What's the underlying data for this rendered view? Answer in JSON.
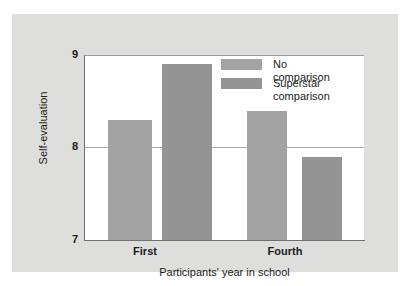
{
  "chart_data": {
    "type": "bar",
    "title": "",
    "xlabel": "Participants' year in school",
    "ylabel": "Self-evaluation",
    "categories": [
      "First",
      "Fourth"
    ],
    "series": [
      {
        "name": "No comparison",
        "values": [
          8.3,
          8.4
        ],
        "color": "#a3a3a3"
      },
      {
        "name": "Superstar\ncomparison",
        "values": [
          8.9,
          7.9
        ],
        "color": "#949494"
      }
    ],
    "ylim": [
      7,
      9
    ],
    "yticks": [
      "9",
      "8",
      "7"
    ],
    "ytick_values": [
      9,
      8,
      7
    ],
    "grid": true,
    "gridlines_at": [
      8
    ],
    "legend_position": "upper-right-inside"
  },
  "axis": {
    "y_title": "Self-evaluation",
    "x_title": "Participants' year in school",
    "y_tick_9": "9",
    "y_tick_8": "8",
    "y_tick_7": "7",
    "x_tick_first": "First",
    "x_tick_fourth": "Fourth"
  },
  "legend": {
    "items": [
      {
        "label": "No comparison"
      },
      {
        "label": "Superstar\ncomparison"
      }
    ]
  },
  "colors": {
    "panel_background": "#dededd",
    "plot_background": "#ffffff",
    "bar_no_comparison": "#a3a3a3",
    "bar_superstar": "#949494",
    "axis_line": "#6f6f6f",
    "gridline": "#a8a8a8",
    "text": "#1b1b1b"
  }
}
